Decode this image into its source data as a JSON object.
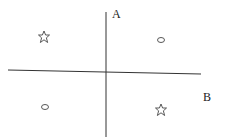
{
  "diagram": {
    "axes": {
      "vertical_label": "A",
      "horizontal_label": "B"
    },
    "markers": [
      {
        "shape": "star",
        "quadrant": "top-left"
      },
      {
        "shape": "oval",
        "quadrant": "top-right"
      },
      {
        "shape": "oval",
        "quadrant": "bottom-left"
      },
      {
        "shape": "star",
        "quadrant": "bottom-right"
      }
    ],
    "colors": {
      "line": "#222222",
      "background": "#ffffff"
    }
  }
}
